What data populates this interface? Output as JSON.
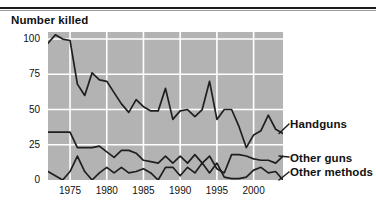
{
  "figure": {
    "title": "Number killed",
    "top_rule": true,
    "background_color": "#ffffff",
    "plot_background_color": "#b3b3b3",
    "gridline_color": "#ffffff",
    "line_color": "#1f1f1f"
  },
  "chart_data": {
    "type": "line",
    "title": "Number killed",
    "xlabel": "",
    "ylabel": "Number killed",
    "xlim": [
      1972,
      2004
    ],
    "ylim": [
      0,
      105
    ],
    "yticks": [
      0,
      25,
      50,
      75,
      100
    ],
    "xticks": [
      1975,
      1980,
      1985,
      1990,
      1995,
      2000
    ],
    "grid": true,
    "legend_position": "right-inline",
    "x": [
      1972,
      1973,
      1974,
      1975,
      1976,
      1977,
      1978,
      1979,
      1980,
      1981,
      1982,
      1983,
      1984,
      1985,
      1986,
      1987,
      1988,
      1989,
      1990,
      1991,
      1992,
      1993,
      1994,
      1995,
      1996,
      1997,
      1998,
      1999,
      2000,
      2001,
      2002,
      2003,
      2004
    ],
    "series": [
      {
        "name": "Handguns",
        "values": [
          97,
          103,
          100,
          99,
          68,
          60,
          76,
          71,
          70,
          62,
          54,
          48,
          57,
          52,
          49,
          49,
          65,
          43,
          49,
          50,
          45,
          50,
          70,
          43,
          50,
          50,
          38,
          23,
          32,
          35,
          46,
          36,
          33
        ]
      },
      {
        "name": "Other guns",
        "values": [
          34,
          34,
          34,
          34,
          23,
          23,
          23,
          24,
          20,
          16,
          21,
          21,
          19,
          14,
          13,
          12,
          17,
          12,
          17,
          12,
          18,
          12,
          17,
          8,
          5,
          18,
          18,
          17,
          15,
          14,
          14,
          12,
          17
        ]
      },
      {
        "name": "Other methods",
        "values": [
          6,
          3,
          0,
          6,
          17,
          6,
          0,
          5,
          9,
          5,
          9,
          5,
          6,
          8,
          5,
          0,
          9,
          9,
          3,
          9,
          5,
          12,
          5,
          12,
          2,
          1,
          1,
          2,
          7,
          9,
          5,
          6,
          0
        ]
      }
    ]
  },
  "axes": {
    "y_tick_labels": [
      "100",
      "75",
      "50",
      "25",
      "0"
    ],
    "x_tick_labels": [
      "1975",
      "1980",
      "1985",
      "1990",
      "1995",
      "2000"
    ]
  },
  "legend": {
    "handguns": "Handguns",
    "other_guns": "Other guns",
    "other_methods": "Other methods"
  }
}
